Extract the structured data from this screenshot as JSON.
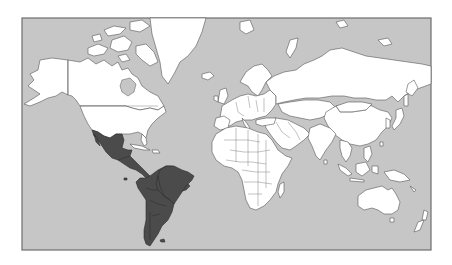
{
  "map": {
    "type": "world-political-outline",
    "projection": "mercator",
    "highlighted_region": "Latin America",
    "highlighted_countries": [
      "Mexico",
      "Central America",
      "South America"
    ],
    "colors": {
      "ocean": "#c6c6c6",
      "land": "#ffffff",
      "highlight": "#4b4b4b",
      "frame": "#6e6e6e",
      "page_background": "#ffffff"
    },
    "frame": {
      "x": 22,
      "y": 18,
      "width": 409,
      "height": 232
    }
  }
}
